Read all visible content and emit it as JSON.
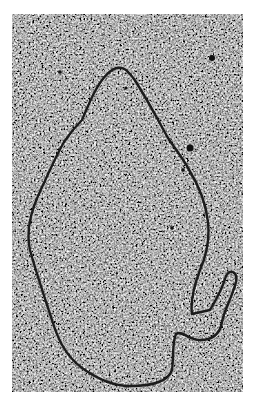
{
  "image": {
    "kind": "electron micrograph",
    "subject": "circular DNA molecule loop on granular background",
    "colors": {
      "background": "#ffffff",
      "field_mid": "#6f6f6f",
      "strand": "#1a1a1a",
      "particle": "#111111"
    },
    "frame": {
      "x": 12,
      "y": 14,
      "width": 231,
      "height": 378
    },
    "strand_path": "M 82 120 C 92 96, 100 78, 112 70 C 122 64, 128 70, 136 82 C 150 104, 160 124, 168 138 C 176 150, 184 160, 188 168 C 198 184, 206 204, 208 222 C 210 240, 206 256, 200 270 C 194 286, 190 300, 192 314 L 210 310 C 216 300, 222 290, 226 276 C 230 268, 238 272, 236 282 C 232 298, 224 310, 222 322 C 220 334, 212 340, 200 340 C 188 340, 182 330, 176 334 C 172 342, 174 356, 172 370 C 168 382, 150 386, 130 386 C 112 386, 96 378, 82 368 C 66 356, 58 340, 52 320 C 44 296, 36 272, 30 250 C 26 232, 30 214, 38 196 C 48 174, 56 156, 64 142 C 72 130, 78 124, 82 120 Z",
    "particles": [
      {
        "cx": 212,
        "cy": 58,
        "r": 3
      },
      {
        "cx": 190,
        "cy": 148,
        "r": 3.5
      },
      {
        "cx": 183,
        "cy": 170,
        "r": 1.8
      },
      {
        "cx": 60,
        "cy": 72,
        "r": 1.8
      },
      {
        "cx": 126,
        "cy": 88,
        "r": 1.5
      },
      {
        "cx": 172,
        "cy": 228,
        "r": 1.8
      }
    ]
  }
}
